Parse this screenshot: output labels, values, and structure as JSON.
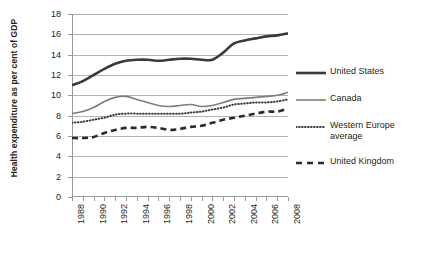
{
  "chart_data": {
    "type": "line",
    "title": "",
    "xlabel": "",
    "ylabel": "Health expenditure as per cent of GDP",
    "ylim": [
      0,
      18
    ],
    "ytick_step": 2,
    "yticks": [
      "0",
      "2",
      "4",
      "6",
      "8",
      "10",
      "12",
      "14",
      "16",
      "18"
    ],
    "xlim": [
      1988,
      2008
    ],
    "x": [
      1988,
      1989,
      1990,
      1991,
      1992,
      1993,
      1994,
      1995,
      1996,
      1997,
      1998,
      1999,
      2000,
      2001,
      2002,
      2003,
      2004,
      2005,
      2006,
      2007,
      2008
    ],
    "xticks_major": [
      "1988",
      "1990",
      "1992",
      "1994",
      "1996",
      "1998",
      "2000",
      "2002",
      "2004",
      "2006",
      "2008"
    ],
    "grid": true,
    "legend_position": "right",
    "series": [
      {
        "name": "United States",
        "style": "solid",
        "color": "#3a3a3a",
        "width": 2.6,
        "values": [
          11.0,
          11.4,
          12.0,
          12.6,
          13.1,
          13.4,
          13.5,
          13.5,
          13.4,
          13.5,
          13.6,
          13.6,
          13.5,
          13.5,
          14.2,
          15.1,
          15.4,
          15.6,
          15.8,
          15.9,
          16.1
        ]
      },
      {
        "name": "Canada",
        "style": "solid",
        "color": "#7d7d7d",
        "width": 1.6,
        "values": [
          8.2,
          8.4,
          8.8,
          9.4,
          9.8,
          9.9,
          9.6,
          9.3,
          9.0,
          8.9,
          9.0,
          9.1,
          8.9,
          9.0,
          9.3,
          9.6,
          9.7,
          9.8,
          9.9,
          10.0,
          10.3
        ]
      },
      {
        "name": "Western Europe average",
        "style": "dotted",
        "color": "#3a3a3a",
        "width": 2.0,
        "values": [
          7.3,
          7.4,
          7.6,
          7.8,
          8.1,
          8.2,
          8.2,
          8.2,
          8.2,
          8.2,
          8.2,
          8.3,
          8.4,
          8.6,
          8.8,
          9.1,
          9.2,
          9.3,
          9.3,
          9.4,
          9.6
        ]
      },
      {
        "name": "United Kingdom",
        "style": "dashed",
        "color": "#2b2b2b",
        "width": 2.6,
        "values": [
          5.8,
          5.8,
          5.9,
          6.3,
          6.6,
          6.8,
          6.8,
          6.9,
          6.8,
          6.6,
          6.7,
          6.9,
          7.0,
          7.3,
          7.6,
          7.8,
          8.0,
          8.2,
          8.4,
          8.4,
          8.7
        ]
      }
    ]
  },
  "legend": {
    "items": [
      {
        "label": "United States",
        "sample": "thick-solid-dark"
      },
      {
        "label": "Canada",
        "sample": "thin-solid-gray"
      },
      {
        "label": "Western Europe average",
        "sample": "dotted"
      },
      {
        "label": "United Kingdom",
        "sample": "dashed"
      }
    ]
  }
}
